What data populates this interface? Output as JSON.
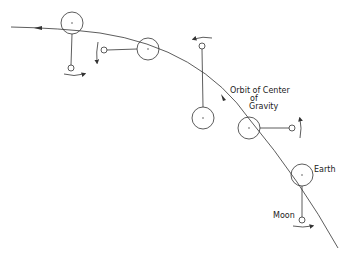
{
  "diagram": {
    "labels": {
      "orbit_line1": "Orbit of Center",
      "orbit_line2": "of",
      "orbit_line3": "Gravity",
      "earth": "Earth",
      "moon": "Moon"
    },
    "colors": {
      "line": "#333333",
      "background": "#ffffff"
    },
    "positions": [
      {
        "earth": [
          72,
          23
        ],
        "moon": [
          71,
          68
        ]
      },
      {
        "earth": [
          148,
          49
        ],
        "moon": [
          104,
          50
        ]
      },
      {
        "earth": [
          203,
          118
        ],
        "moon": [
          202,
          46
        ]
      },
      {
        "earth": [
          249,
          128
        ],
        "moon": [
          292,
          128
        ]
      },
      {
        "earth": [
          302,
          175
        ],
        "moon": [
          302,
          220
        ]
      }
    ]
  }
}
